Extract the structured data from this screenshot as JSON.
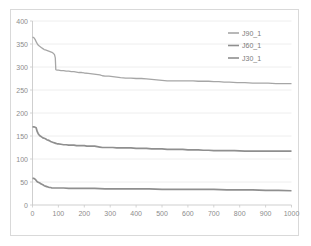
{
  "chart_data": {
    "type": "line",
    "title": "",
    "subtitle": "",
    "xlabel": "",
    "ylabel": "",
    "xlim": [
      0,
      1000
    ],
    "ylim": [
      0,
      400
    ],
    "grid": "horizontal",
    "legend_position": "top-right-inside",
    "x_ticks": [
      0,
      100,
      200,
      300,
      400,
      500,
      600,
      700,
      800,
      900,
      1000
    ],
    "y_ticks": [
      0,
      50,
      100,
      150,
      200,
      250,
      300,
      350,
      400
    ],
    "x_tick_labels": [
      "0",
      "100",
      "200",
      "300",
      "400",
      "500",
      "600",
      "700",
      "800",
      "900",
      "1000"
    ],
    "y_tick_labels": [
      "0",
      "50",
      "100",
      "150",
      "200",
      "250",
      "300",
      "350",
      "400"
    ],
    "series": [
      {
        "name": "J90_1",
        "color": "#a6a6a6",
        "width": 1.3,
        "x": [
          0,
          5,
          10,
          15,
          20,
          25,
          30,
          35,
          40,
          45,
          50,
          55,
          60,
          65,
          70,
          75,
          80,
          85,
          88,
          90,
          95,
          100,
          110,
          120,
          130,
          140,
          150,
          160,
          170,
          180,
          190,
          200,
          215,
          230,
          245,
          260,
          270,
          280,
          295,
          310,
          325,
          340,
          360,
          380,
          400,
          420,
          440,
          460,
          480,
          500,
          520,
          540,
          560,
          580,
          600,
          620,
          640,
          660,
          680,
          700,
          720,
          740,
          760,
          790,
          820,
          850,
          880,
          910,
          940,
          970,
          1000
        ],
        "y": [
          365,
          364,
          360,
          354,
          349,
          346,
          344,
          342,
          340,
          338,
          337,
          336,
          335,
          334,
          333,
          332,
          330,
          327,
          320,
          294,
          293,
          293,
          292,
          292,
          291,
          291,
          290,
          290,
          289,
          288,
          288,
          287,
          286,
          285,
          284,
          283,
          281,
          280,
          280,
          279,
          278,
          277,
          276,
          276,
          275,
          275,
          274,
          273,
          272,
          271,
          270,
          270,
          270,
          270,
          270,
          270,
          269,
          269,
          269,
          268,
          268,
          267,
          267,
          266,
          266,
          265,
          265,
          265,
          264,
          264,
          264
        ]
      },
      {
        "name": "J60_1",
        "color": "#8f8f8f",
        "width": 1.7,
        "x": [
          0,
          5,
          10,
          14,
          18,
          22,
          26,
          30,
          35,
          40,
          45,
          50,
          55,
          60,
          65,
          70,
          75,
          80,
          85,
          90,
          95,
          100,
          110,
          120,
          130,
          140,
          150,
          160,
          170,
          180,
          190,
          200,
          210,
          220,
          230,
          240,
          250,
          260,
          270,
          280,
          295,
          310,
          325,
          340,
          360,
          380,
          400,
          420,
          440,
          460,
          480,
          500,
          520,
          540,
          560,
          580,
          600,
          620,
          640,
          660,
          680,
          700,
          720,
          750,
          780,
          820,
          860,
          900,
          940,
          970,
          1000
        ],
        "y": [
          170,
          170,
          169,
          168,
          160,
          155,
          152,
          150,
          148,
          146,
          145,
          144,
          142,
          141,
          140,
          138,
          137,
          136,
          135,
          134,
          133,
          133,
          132,
          131,
          131,
          130,
          130,
          130,
          129,
          129,
          129,
          129,
          128,
          128,
          128,
          128,
          127,
          126,
          125,
          125,
          125,
          125,
          124,
          124,
          124,
          124,
          123,
          123,
          123,
          122,
          122,
          122,
          121,
          121,
          121,
          121,
          120,
          120,
          120,
          119,
          119,
          118,
          118,
          118,
          118,
          117,
          117,
          117,
          117,
          117,
          117
        ]
      },
      {
        "name": "J30_1",
        "color": "#8f8f8f",
        "width": 1.7,
        "x": [
          0,
          4,
          8,
          12,
          16,
          20,
          24,
          28,
          32,
          36,
          40,
          45,
          50,
          55,
          60,
          65,
          70,
          75,
          80,
          90,
          100,
          120,
          140,
          160,
          180,
          200,
          240,
          280,
          320,
          360,
          400,
          450,
          500,
          550,
          600,
          650,
          700,
          750,
          800,
          850,
          900,
          950,
          1000
        ],
        "y": [
          58,
          58,
          57,
          55,
          52,
          50,
          49,
          48,
          46,
          45,
          44,
          42,
          41,
          40,
          39,
          38,
          38,
          37,
          37,
          37,
          37,
          37,
          36,
          36,
          36,
          36,
          36,
          35,
          35,
          35,
          35,
          35,
          34,
          34,
          34,
          34,
          34,
          33,
          33,
          33,
          32,
          32,
          31
        ]
      }
    ]
  },
  "legend": {
    "entries": [
      {
        "label": "J90_1"
      },
      {
        "label": "J60_1"
      },
      {
        "label": "J30_1"
      }
    ]
  }
}
